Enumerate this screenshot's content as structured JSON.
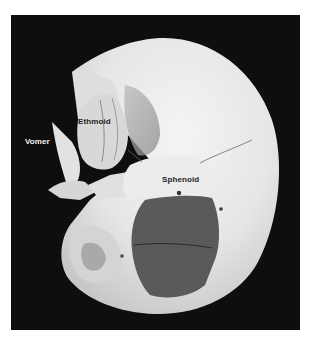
{
  "figure": {
    "background_color": "#0e0e0e",
    "bone_color": "#e8e8e8",
    "shadow_color": "#5a5a5a",
    "labels": [
      {
        "text": "Vomer",
        "x": 25,
        "y": 137,
        "style": "light"
      },
      {
        "text": "Ethmoid",
        "x": 78,
        "y": 117,
        "style": "dark"
      },
      {
        "text": "Sphenoid",
        "x": 162,
        "y": 175,
        "style": "dark"
      }
    ]
  }
}
